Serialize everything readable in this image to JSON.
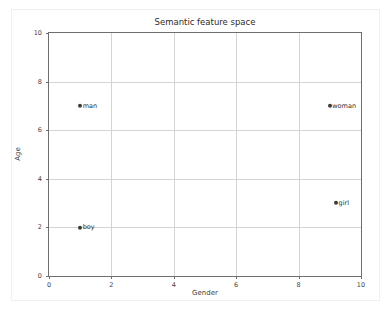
{
  "chart_data": {
    "type": "scatter",
    "title": "Semantic feature space",
    "xlabel": "Gender",
    "ylabel": "Age",
    "xlim": [
      0,
      10
    ],
    "ylim": [
      0,
      10
    ],
    "xticks": [
      "0",
      "2",
      "4",
      "6",
      "8",
      "10"
    ],
    "yticks": [
      "0",
      "2",
      "4",
      "6",
      "8",
      "10"
    ],
    "xtick_values": [
      0,
      2,
      4,
      6,
      8,
      10
    ],
    "ytick_values": [
      0,
      2,
      4,
      6,
      8,
      10
    ],
    "grid": true,
    "legend": "none",
    "marker_color": "#3b3b3b",
    "points": [
      {
        "label": "man",
        "x": 1,
        "y": 7
      },
      {
        "label": "woman",
        "x": 9,
        "y": 7
      },
      {
        "label": "girl",
        "x": 9.2,
        "y": 3
      },
      {
        "label": "boy",
        "x": 1,
        "y": 2
      }
    ]
  }
}
